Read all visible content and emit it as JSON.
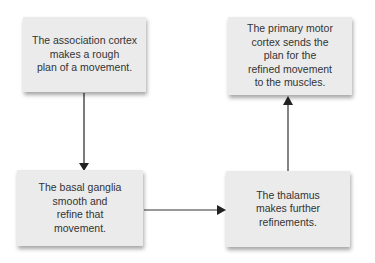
{
  "diagram": {
    "type": "flowchart",
    "nodes": [
      {
        "id": "assoc",
        "lines": [
          "The association cortex",
          "makes a rough",
          "plan of a movement."
        ]
      },
      {
        "id": "basal",
        "lines": [
          "The basal ganglia",
          "smooth and",
          "refine that",
          "movement."
        ]
      },
      {
        "id": "thal",
        "lines": [
          "The thalamus",
          "makes further",
          "refinements."
        ]
      },
      {
        "id": "motor",
        "lines": [
          "The primary motor",
          "cortex sends the",
          "plan for the",
          "refined movement",
          "to the muscles."
        ]
      }
    ],
    "edges": [
      {
        "from": "assoc",
        "to": "basal",
        "direction": "down"
      },
      {
        "from": "basal",
        "to": "thal",
        "direction": "right"
      },
      {
        "from": "thal",
        "to": "motor",
        "direction": "up"
      }
    ],
    "colors": {
      "box_fill": "#ebebeb",
      "text": "#333333",
      "arrow": "#222222"
    }
  }
}
